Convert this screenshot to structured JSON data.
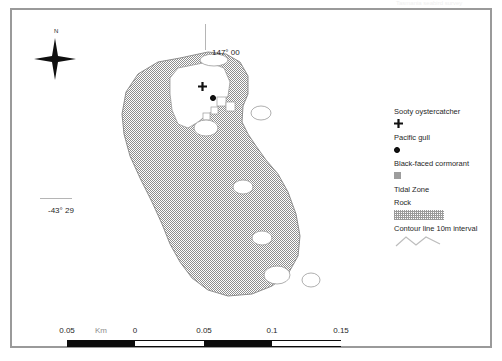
{
  "page": {
    "header_ghost": "Tasmania seabird survey",
    "frame_color": "#9a9a9a"
  },
  "compass": {
    "north_label": "N",
    "icon": "compass-star-icon"
  },
  "graticule": {
    "longitude_label": "147° 00",
    "latitude_label": "-43° 29"
  },
  "legend": {
    "entries": [
      {
        "label": "Sooty oystercatcher",
        "symbol": "cross-marker-icon",
        "color": "#131313"
      },
      {
        "label": "Pacific gull",
        "symbol": "dot-marker-icon",
        "color": "#131313"
      },
      {
        "label": "Black-faced cormorant",
        "symbol": "square-marker-icon",
        "color": "#9d9d9d"
      },
      {
        "label": "Tidal Zone",
        "symbol": "none",
        "color": "#ffffff"
      },
      {
        "label": "Rock",
        "symbol": "rock-swatch-icon",
        "color": "#9b9b9b"
      },
      {
        "label": "Contour line 10m interval",
        "symbol": "contour-line-icon",
        "color": "#b8b8b8"
      }
    ]
  },
  "scalebar": {
    "unit_label": "Km",
    "ticks": [
      "0.05",
      "0",
      "0.05",
      "0.1",
      "0.15"
    ],
    "tick_positions": [
      0,
      68,
      137,
      205,
      274
    ],
    "unit_position": 34,
    "segments": [
      {
        "left": 0,
        "width": 68,
        "fill": "dark"
      },
      {
        "left": 68,
        "width": 69,
        "fill": "light"
      },
      {
        "left": 137,
        "width": 68,
        "fill": "dark"
      },
      {
        "left": 205,
        "width": 69,
        "fill": "light"
      }
    ]
  },
  "map": {
    "rock_fill": "#9b9b9b",
    "tidal_fill": "#ffffff",
    "outline": "#8f8f8f",
    "markers": [
      {
        "type": "cross-marker-icon",
        "name": "sooty-oystercatcher-marker",
        "x": 188,
        "y": 70
      },
      {
        "type": "dot-marker-icon",
        "name": "pacific-gull-marker",
        "x": 200,
        "y": 87
      }
    ]
  }
}
